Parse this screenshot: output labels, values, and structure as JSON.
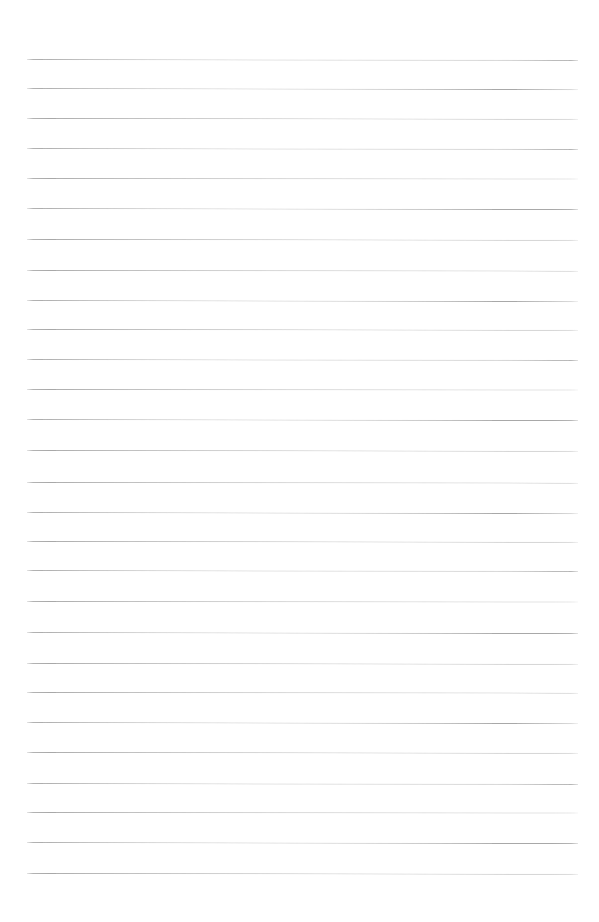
{
  "document": {
    "type": "lined-paper",
    "title": "Blank ruled notepaper page",
    "content_text": "",
    "page_width": 599,
    "page_height": 922,
    "background_color": "#ffffff",
    "has_handwriting": false,
    "has_margin_rule": false
  },
  "ruling": {
    "line_color": "#a9a9a9",
    "line_thickness_px": 1,
    "line_count": 28,
    "line_spacing_px": 30.1,
    "first_line_y": 59,
    "last_line_y": 873,
    "left_edge_x": 27,
    "right_edge_x": 578,
    "line_length_px": 551,
    "top_margin_px": 59,
    "bottom_margin_px": 49,
    "lines": [
      {
        "index": 1,
        "y": 59,
        "x1": 27,
        "x2": 578,
        "tilt_deg": 0.1
      },
      {
        "index": 2,
        "y": 88,
        "x1": 27,
        "x2": 578,
        "tilt_deg": 0.12
      },
      {
        "index": 3,
        "y": 118,
        "x1": 27,
        "x2": 578,
        "tilt_deg": 0.08
      },
      {
        "index": 4,
        "y": 148,
        "x1": 27,
        "x2": 578,
        "tilt_deg": 0.1
      },
      {
        "index": 5,
        "y": 178,
        "x1": 27,
        "x2": 578,
        "tilt_deg": 0.06
      },
      {
        "index": 6,
        "y": 208,
        "x1": 27,
        "x2": 578,
        "tilt_deg": 0.11
      },
      {
        "index": 7,
        "y": 239,
        "x1": 27,
        "x2": 578,
        "tilt_deg": 0.09
      },
      {
        "index": 8,
        "y": 270,
        "x1": 27,
        "x2": 578,
        "tilt_deg": 0.07
      },
      {
        "index": 9,
        "y": 300,
        "x1": 27,
        "x2": 578,
        "tilt_deg": 0.12
      },
      {
        "index": 10,
        "y": 329,
        "x1": 27,
        "x2": 578,
        "tilt_deg": 0.08
      },
      {
        "index": 11,
        "y": 359,
        "x1": 27,
        "x2": 578,
        "tilt_deg": 0.1
      },
      {
        "index": 12,
        "y": 389,
        "x1": 27,
        "x2": 578,
        "tilt_deg": 0.06
      },
      {
        "index": 13,
        "y": 419,
        "x1": 27,
        "x2": 578,
        "tilt_deg": 0.11
      },
      {
        "index": 14,
        "y": 450,
        "x1": 27,
        "x2": 578,
        "tilt_deg": 0.09
      },
      {
        "index": 15,
        "y": 482,
        "x1": 27,
        "x2": 578,
        "tilt_deg": 0.07
      },
      {
        "index": 16,
        "y": 512,
        "x1": 27,
        "x2": 578,
        "tilt_deg": 0.12
      },
      {
        "index": 17,
        "y": 541,
        "x1": 27,
        "x2": 578,
        "tilt_deg": 0.08
      },
      {
        "index": 18,
        "y": 570,
        "x1": 27,
        "x2": 578,
        "tilt_deg": 0.1
      },
      {
        "index": 19,
        "y": 601,
        "x1": 27,
        "x2": 578,
        "tilt_deg": 0.06
      },
      {
        "index": 20,
        "y": 632,
        "x1": 27,
        "x2": 578,
        "tilt_deg": 0.11
      },
      {
        "index": 21,
        "y": 663,
        "x1": 27,
        "x2": 578,
        "tilt_deg": 0.09
      },
      {
        "index": 22,
        "y": 692,
        "x1": 27,
        "x2": 578,
        "tilt_deg": 0.07
      },
      {
        "index": 23,
        "y": 722,
        "x1": 27,
        "x2": 578,
        "tilt_deg": 0.12
      },
      {
        "index": 24,
        "y": 752,
        "x1": 27,
        "x2": 578,
        "tilt_deg": 0.08
      },
      {
        "index": 25,
        "y": 783,
        "x1": 27,
        "x2": 578,
        "tilt_deg": 0.1
      },
      {
        "index": 26,
        "y": 812,
        "x1": 27,
        "x2": 578,
        "tilt_deg": 0.06
      },
      {
        "index": 27,
        "y": 842,
        "x1": 27,
        "x2": 578,
        "tilt_deg": 0.11
      },
      {
        "index": 28,
        "y": 873,
        "x1": 27,
        "x2": 578,
        "tilt_deg": 0.09
      }
    ]
  }
}
